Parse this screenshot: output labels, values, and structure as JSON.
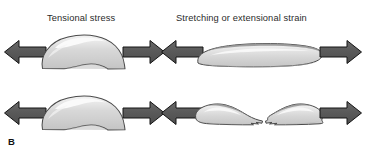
{
  "figure": {
    "panel_label": "B",
    "background_color": "#ffffff",
    "titles": {
      "left": "Tensional stress",
      "right": "Stretching or extensional strain"
    },
    "colors": {
      "arrow_fill": "#595959",
      "arrow_stroke": "#1a1a1a",
      "rock_fill_light": "#eaeaea",
      "rock_fill_mid": "#d2d2d2",
      "rock_fill_dark": "#b9b9b9",
      "rock_stroke": "#4a4a4a",
      "text_color": "#2b2b2b"
    },
    "rows": [
      {
        "name": "undeformed-row",
        "left_panel": {
          "shape_name": "rock-blob-unstretched",
          "arrows": [
            "arrow-left",
            "arrow-right"
          ]
        },
        "right_panel": {
          "shape_name": "rock-blob-stretched",
          "arrows": [
            "arrow-left",
            "arrow-right"
          ]
        }
      },
      {
        "name": "fractured-row",
        "left_panel": {
          "shape_name": "rock-blob-unstretched",
          "arrows": [
            "arrow-left",
            "arrow-right"
          ]
        },
        "right_panel": {
          "shape_name": "rock-blob-fractured",
          "arrows": [
            "arrow-left",
            "arrow-right"
          ]
        }
      }
    ]
  }
}
